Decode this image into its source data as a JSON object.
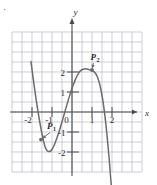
{
  "chart_data": {
    "type": "line",
    "title": "",
    "xlabel": "x",
    "ylabel": "y",
    "xlim": [
      -2.6,
      2.4
    ],
    "ylim": [
      -2.6,
      2.5
    ],
    "grid": true,
    "grid_step": 0.5,
    "legend": "none",
    "x_ticks": [
      "-2",
      "-1",
      "0",
      "1",
      "2"
    ],
    "x_tick_values": [
      -2,
      -1,
      0,
      1,
      2
    ],
    "y_ticks": [
      "2",
      "1",
      "-1",
      "-2"
    ],
    "y_tick_values": [
      2,
      1,
      -1,
      -2
    ],
    "curve_description": "cubic polynomial with local minimum and local maximum",
    "series": [
      {
        "name": "cubic curve",
        "color": "#6b6b6b",
        "x": [
          -2.05,
          -1.95,
          -1.85,
          -1.75,
          -1.65,
          -1.55,
          -1.45,
          -1.35,
          -1.25,
          -1.15,
          -1.05,
          -0.95,
          -0.85,
          -0.75,
          -0.65,
          -0.55,
          -0.45,
          -0.35,
          -0.25,
          -0.15,
          -0.05,
          0.05,
          0.15,
          0.25,
          0.35,
          0.45,
          0.55,
          0.65,
          0.75,
          0.85,
          0.95,
          1.05,
          1.15,
          1.25,
          1.35,
          1.45,
          1.55,
          1.65,
          1.75,
          1.85,
          1.95,
          2.05,
          2.15
        ],
        "y": [
          2.52,
          1.74,
          1.01,
          0.34,
          -0.28,
          -0.84,
          -1.33,
          -1.72,
          -1.93,
          -1.98,
          -1.93,
          -1.78,
          -1.56,
          -1.29,
          -0.99,
          -0.66,
          -0.32,
          0.03,
          0.38,
          0.72,
          1.03,
          1.32,
          1.58,
          1.8,
          1.97,
          2.08,
          2.14,
          2.16,
          2.15,
          2.12,
          2.08,
          2.04,
          1.96,
          1.8,
          1.52,
          1.1,
          0.53,
          -0.22,
          -1.15,
          -2.25,
          -3.5,
          -4.6,
          -5.6
        ]
      }
    ],
    "annotations": [
      {
        "id": "P1",
        "label": "P",
        "subscript": "1",
        "point_x": -1.55,
        "point_y": -1.38,
        "label_x": -0.95,
        "label_y": -0.85,
        "marker": true,
        "has_arrow": true
      },
      {
        "id": "P2",
        "label": "P",
        "subscript": "2",
        "point_x": 1.0,
        "point_y": 2.1,
        "label_x": 1.22,
        "label_y": 2.62,
        "marker": true,
        "has_arrow": true
      }
    ],
    "axis_arrows": {
      "x_positive": true,
      "y_positive": true
    },
    "colors": {
      "curve": "#6b6b6b",
      "grid": "#b9b9c4",
      "axis": "#4a4a4a",
      "text": "#2b2b2b",
      "background": "#ffffff"
    }
  },
  "figure": {
    "origin_label": "0",
    "corner_mark": "·"
  }
}
